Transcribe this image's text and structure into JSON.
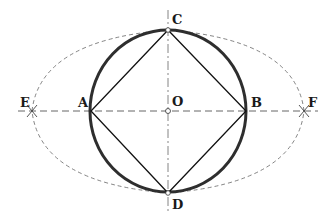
{
  "diagram": {
    "title": "",
    "colors": {
      "ink": "#1a1a1a",
      "circle": "#333333",
      "construction": "#555555",
      "background": "#ffffff"
    },
    "center": {
      "x": 168,
      "y": 111
    },
    "circle": {
      "rx": 78,
      "ry": 81
    },
    "points": {
      "A": {
        "label": "A",
        "x": 91,
        "y": 111
      },
      "B": {
        "label": "B",
        "x": 246,
        "y": 111
      },
      "C": {
        "label": "C",
        "x": 168,
        "y": 30
      },
      "D": {
        "label": "D",
        "x": 168,
        "y": 193
      },
      "O": {
        "label": "O",
        "x": 168,
        "y": 111
      },
      "E": {
        "label": "E",
        "x": 32,
        "y": 111
      },
      "F": {
        "label": "F",
        "x": 304,
        "y": 111
      }
    },
    "labels": {
      "A": "A",
      "B": "B",
      "C": "C",
      "D": "D",
      "O": "O",
      "E": "E",
      "F": "F"
    },
    "elements": [
      "circle through A, C, B, D (thick)",
      "inscribed square ACBD",
      "horizontal dashed axis through E, A, O, B, F",
      "vertical dash-dot axis through C, O, D",
      "dashed arc C-E-D",
      "dashed arc C-F-D",
      "cross marks at E and F",
      "small hollow circles at C, O, D"
    ]
  }
}
